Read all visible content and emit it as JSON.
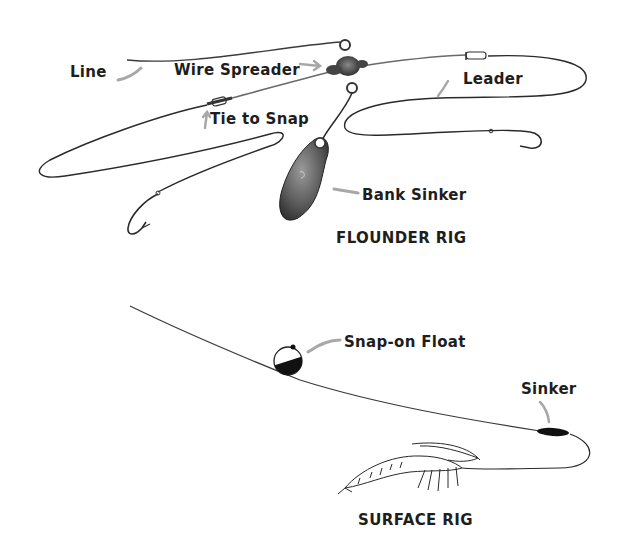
{
  "diagrams": [
    {
      "title": "FLOUNDER RIG",
      "labels": {
        "line": "Line",
        "wire_spreader": "Wire Spreader",
        "leader": "Leader",
        "tie_to_snap": "Tie to Snap",
        "bank_sinker": "Bank Sinker"
      }
    },
    {
      "title": "SURFACE RIG",
      "labels": {
        "snap_on_float": "Snap-on Float",
        "sinker": "Sinker"
      }
    }
  ],
  "colors": {
    "line": "#2a2a2a",
    "arrow": "#a8a8a8",
    "text": "#1e1e1e",
    "background": "#ffffff"
  }
}
